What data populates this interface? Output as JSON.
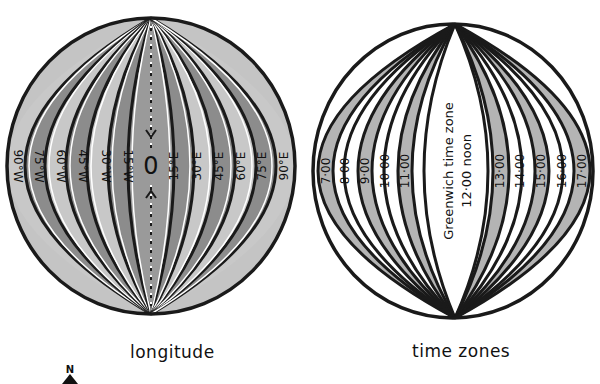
{
  "figure": {
    "left_globe": {
      "caption": "longitude",
      "prime_meridian_label": "0",
      "west_labels": [
        "90°W",
        "75°W",
        "60°W",
        "45°W",
        "30°W",
        "15°W"
      ],
      "east_labels": [
        "15°E",
        "30°E",
        "45°E",
        "60°E",
        "75°E",
        "90°E"
      ]
    },
    "right_globe": {
      "caption": "time zones",
      "center_label_line1": "Greenwich time zone",
      "center_label_line2": "12·00 noon",
      "west_labels": [
        "7·00",
        "8·00",
        "9·00",
        "10·00",
        "11·00"
      ],
      "east_labels": [
        "13·00",
        "14·00",
        "15·00",
        "16·00",
        "17·00"
      ]
    },
    "compass": {
      "label": "N",
      "icon": "north-arrow-icon"
    },
    "colors": {
      "outline": "#1a1a1a",
      "band_dark": "#8c8c8c",
      "band_light": "#c8c8c8",
      "background": "#ffffff"
    }
  }
}
